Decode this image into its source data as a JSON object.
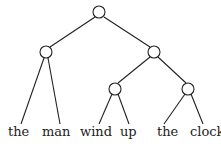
{
  "diagram": {
    "type": "binary syntax tree",
    "leaves": [
      "the",
      "man",
      "wind",
      "up",
      "the",
      "clock"
    ],
    "colors": {
      "line": "#222222",
      "background": "#ffffff"
    }
  }
}
